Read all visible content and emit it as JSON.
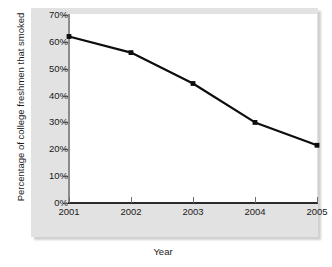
{
  "chart_data": {
    "type": "line",
    "title": "",
    "xlabel": "Year",
    "ylabel": "Percentage of college freshmen that smoked",
    "categories": [
      "2001",
      "2002",
      "2003",
      "2004",
      "2005"
    ],
    "x": [
      2001,
      2002,
      2003,
      2004,
      2005
    ],
    "values": [
      62,
      56,
      44.5,
      30,
      21.5
    ],
    "series": [
      {
        "name": "Percentage of college freshmen that smoked",
        "values": [
          62,
          56,
          44.5,
          30,
          21.5
        ]
      }
    ],
    "ylim": [
      0,
      70
    ],
    "ytick_labels": [
      "0%",
      "10%",
      "20%",
      "30%",
      "40%",
      "50%",
      "60%",
      "70%"
    ],
    "ytick_values": [
      0,
      10,
      20,
      30,
      40,
      50,
      60,
      70
    ],
    "xtick_labels": [
      "2001",
      "2002",
      "2003",
      "2004",
      "2005"
    ],
    "grid": false,
    "legend": false,
    "marker": "square",
    "line_color": "#0d0d0d",
    "marker_color": "#0d0d0d",
    "plot_background": "#ffffff",
    "panel_background": "#e2e2e2",
    "axis_color_y": "#8c8c8c",
    "axis_color_x": "#2b2b2b",
    "text_color": "#1a1a1a"
  }
}
